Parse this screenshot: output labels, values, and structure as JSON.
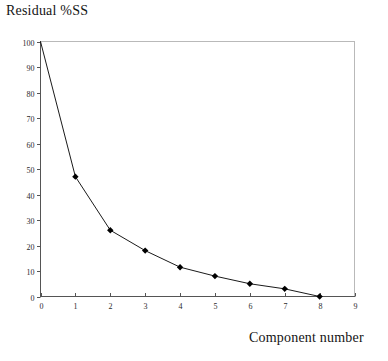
{
  "chart_data": {
    "type": "line",
    "title": "Residual %SS",
    "xlabel": "Component number",
    "ylabel": "",
    "x": [
      0,
      1,
      2,
      3,
      4,
      5,
      6,
      7,
      8
    ],
    "values": [
      100,
      47,
      26,
      18,
      11.5,
      8,
      5,
      3,
      0
    ],
    "series": [
      {
        "name": "Residual %SS",
        "values": [
          100,
          47,
          26,
          18,
          11.5,
          8,
          5,
          3,
          0
        ]
      }
    ],
    "xlim": [
      0,
      9
    ],
    "ylim": [
      0,
      100
    ],
    "xticks": [
      0,
      1,
      2,
      3,
      4,
      5,
      6,
      7,
      8,
      9
    ],
    "xtick_labels": [
      "0",
      "1",
      "2",
      "3",
      "4",
      "5",
      "6",
      "7",
      "8",
      "9"
    ],
    "yticks": [
      0,
      10,
      20,
      30,
      40,
      50,
      60,
      70,
      80,
      90,
      100
    ],
    "ytick_labels": [
      "0",
      "10",
      "20",
      "30",
      "40",
      "50",
      "60",
      "70",
      "80",
      "90",
      "100"
    ],
    "grid": false,
    "legend": false,
    "marker": "diamond",
    "line_color": "#000000",
    "marker_color": "#000000",
    "axis_color": "#555555",
    "frame_color": "#b9b9b9",
    "background": "#ffffff"
  }
}
